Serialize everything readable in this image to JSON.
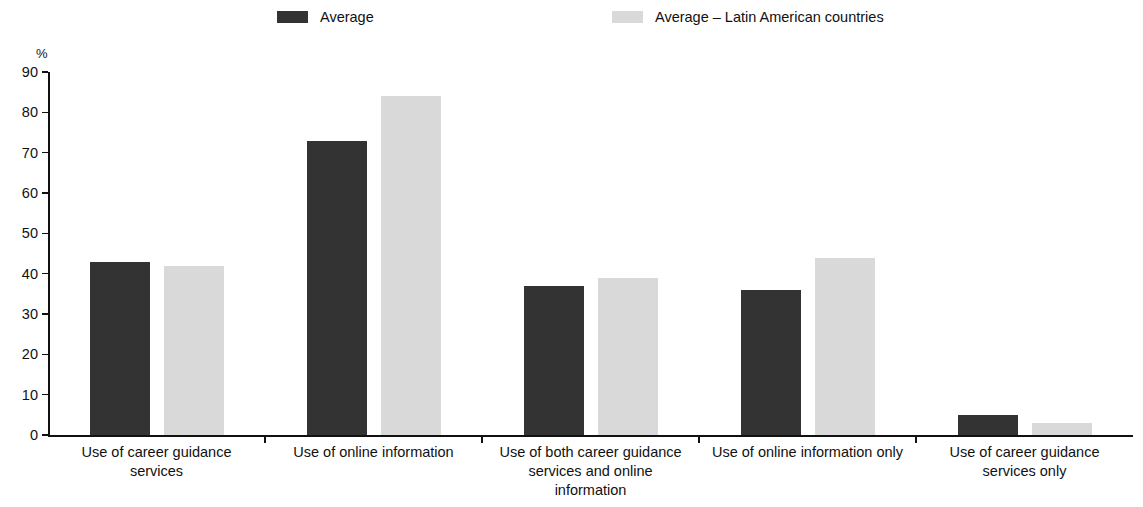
{
  "chart_data": {
    "type": "bar",
    "title": "",
    "xlabel": "",
    "ylabel": "%",
    "ylim": [
      0,
      90
    ],
    "yticks": [
      0,
      10,
      20,
      30,
      40,
      50,
      60,
      70,
      80,
      90
    ],
    "grid": false,
    "legend_position": "top",
    "categories": [
      "Use of career guidance services",
      "Use of online information",
      "Use of both career guidance services and online information",
      "Use of online information only",
      "Use of career guidance services only"
    ],
    "category_lines": [
      [
        "Use of career guidance",
        "services"
      ],
      [
        "Use of online information"
      ],
      [
        "Use of both career guidance",
        "services and online",
        "information"
      ],
      [
        "Use of online information only"
      ],
      [
        "Use of career guidance",
        "services only"
      ]
    ],
    "series": [
      {
        "name": "Average",
        "color": "#333333",
        "values": [
          43,
          73,
          37,
          36,
          5
        ]
      },
      {
        "name": "Average – Latin American countries",
        "color": "#d9d9d9",
        "values": [
          42,
          84,
          39,
          44,
          3
        ]
      }
    ]
  },
  "legend": {
    "items": [
      {
        "label": "Average",
        "color": "#333333"
      },
      {
        "label": "Average – Latin American countries",
        "color": "#d9d9d9"
      }
    ]
  },
  "axis": {
    "unit": "%",
    "tick_labels": [
      "90",
      "80",
      "70",
      "60",
      "50",
      "40",
      "30",
      "20",
      "10",
      "0"
    ]
  }
}
